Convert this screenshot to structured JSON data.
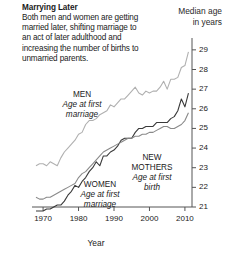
{
  "header": {
    "title": "Marrying Later",
    "description": "Both men and women are getting married later, shifting marriage to an act of later adulthood and increasing the number of births to unmarried parents.",
    "axis_title_line1": "Median age",
    "axis_title_line2": "in years"
  },
  "chart_data": {
    "type": "line",
    "title": "Marrying Later",
    "xlabel": "Year",
    "ylabel": "Median age in years",
    "xlim": [
      1968,
      2012
    ],
    "ylim": [
      21,
      29.4
    ],
    "xticks": [
      1970,
      1980,
      1990,
      2000,
      2010
    ],
    "yticks": [
      21,
      22,
      23,
      24,
      25,
      26,
      27,
      28,
      29
    ],
    "grid": false,
    "legend": "inline-annotations",
    "series": [
      {
        "name": "MEN",
        "sublabel": "Age at first marriage",
        "color": "#b0b0b0",
        "x": [
          1968,
          1969,
          1970,
          1971,
          1972,
          1973,
          1974,
          1975,
          1976,
          1977,
          1978,
          1979,
          1980,
          1981,
          1982,
          1983,
          1984,
          1985,
          1986,
          1987,
          1988,
          1989,
          1990,
          1991,
          1992,
          1993,
          1994,
          1995,
          1996,
          1997,
          1998,
          1999,
          2000,
          2001,
          2002,
          2003,
          2004,
          2005,
          2006,
          2007,
          2008,
          2009,
          2010,
          2011
        ],
        "values": [
          23.1,
          23.2,
          23.2,
          23.1,
          23.3,
          23.2,
          23.1,
          23.5,
          23.8,
          24.0,
          24.2,
          24.4,
          24.7,
          24.8,
          25.2,
          25.4,
          25.4,
          25.5,
          25.7,
          25.8,
          25.9,
          26.2,
          26.1,
          26.3,
          26.5,
          26.5,
          26.7,
          26.9,
          27.1,
          26.8,
          26.7,
          26.9,
          26.8,
          26.9,
          26.9,
          27.1,
          27.4,
          27.0,
          27.5,
          27.5,
          27.6,
          28.1,
          28.2,
          28.9
        ]
      },
      {
        "name": "WOMEN",
        "sublabel": "Age at first marriage",
        "color": "#3a3a3a",
        "x": [
          1968,
          1969,
          1970,
          1971,
          1972,
          1973,
          1974,
          1975,
          1976,
          1977,
          1978,
          1979,
          1980,
          1981,
          1982,
          1983,
          1984,
          1985,
          1986,
          1987,
          1988,
          1989,
          1990,
          1991,
          1992,
          1993,
          1994,
          1995,
          1996,
          1997,
          1998,
          1999,
          2000,
          2001,
          2002,
          2003,
          2004,
          2005,
          2006,
          2007,
          2008,
          2009,
          2010,
          2011
        ],
        "values": [
          20.8,
          20.8,
          20.8,
          20.9,
          20.9,
          21.0,
          21.1,
          21.1,
          21.3,
          21.6,
          21.8,
          22.1,
          22.0,
          22.3,
          22.5,
          22.8,
          23.0,
          23.3,
          23.1,
          23.6,
          23.6,
          23.8,
          23.9,
          24.1,
          24.4,
          24.5,
          24.5,
          24.5,
          24.8,
          25.0,
          25.0,
          25.1,
          25.1,
          25.1,
          25.3,
          25.3,
          25.3,
          25.3,
          25.5,
          25.6,
          25.9,
          26.5,
          26.1,
          26.8
        ]
      },
      {
        "name": "NEW MOTHERS",
        "sublabel": "Age at first birth",
        "color": "#8a8a8a",
        "x": [
          1968,
          1969,
          1970,
          1971,
          1972,
          1973,
          1974,
          1975,
          1976,
          1977,
          1978,
          1979,
          1980,
          1981,
          1982,
          1983,
          1984,
          1985,
          1986,
          1987,
          1988,
          1989,
          1990,
          1991,
          1992,
          1993,
          1994,
          1995,
          1996,
          1997,
          1998,
          1999,
          2000,
          2001,
          2002,
          2003,
          2004,
          2005,
          2006,
          2007,
          2008,
          2009,
          2010,
          2011
        ],
        "values": [
          21.5,
          21.4,
          21.4,
          21.5,
          21.5,
          21.6,
          21.7,
          21.8,
          21.9,
          22.0,
          22.1,
          22.2,
          22.5,
          22.7,
          22.8,
          23.0,
          23.2,
          23.4,
          23.6,
          23.8,
          23.9,
          24.0,
          24.1,
          24.2,
          24.3,
          24.4,
          24.5,
          24.5,
          24.6,
          24.6,
          24.7,
          24.7,
          24.8,
          24.8,
          24.9,
          25.0,
          25.1,
          25.1,
          25.0,
          25.0,
          25.1,
          25.2,
          25.4,
          25.8
        ]
      }
    ]
  }
}
